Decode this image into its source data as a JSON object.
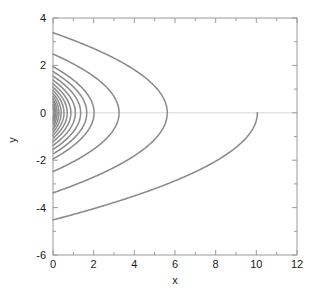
{
  "figure": {
    "background_color": "#ffffff",
    "plot_box": {
      "left": 53,
      "top": 18,
      "right": 297,
      "bottom": 255,
      "border_color": "#9a9a9a"
    }
  },
  "chart_data": {
    "type": "line",
    "title": "",
    "subtitle": "",
    "xlabel": "x",
    "ylabel": "y",
    "xlim": [
      0,
      12
    ],
    "ylim": [
      -6,
      4
    ],
    "xticks": [
      0,
      2,
      4,
      6,
      8,
      10,
      12
    ],
    "xtick_labels": [
      "0",
      "2",
      "4",
      "6",
      "8",
      "10",
      "12"
    ],
    "yticks": [
      -6,
      -4,
      -2,
      0,
      2,
      4
    ],
    "ytick_labels": [
      "-6",
      "-4",
      "-2",
      "0",
      "2",
      "4"
    ],
    "xminor_ticks": [
      1,
      3,
      5,
      7,
      9,
      11
    ],
    "yminor_ticks": [
      -5,
      -3,
      -1,
      1,
      3
    ],
    "grid": false,
    "legend": null,
    "annotations": [],
    "series_color": "#808080",
    "series_linewidth": 1.6,
    "zero_line_color": "#d8d8d8",
    "series": [
      {
        "name": "orbit-01",
        "y_at_x0": 0.22,
        "vertex_x": 0.035,
        "half": "full"
      },
      {
        "name": "orbit-02",
        "y_at_x0": 0.34,
        "vertex_x": 0.075,
        "half": "full"
      },
      {
        "name": "orbit-03",
        "y_at_x0": 0.46,
        "vertex_x": 0.13,
        "half": "full"
      },
      {
        "name": "orbit-04",
        "y_at_x0": 0.58,
        "vertex_x": 0.2,
        "half": "full"
      },
      {
        "name": "orbit-05",
        "y_at_x0": 0.7,
        "vertex_x": 0.29,
        "half": "full"
      },
      {
        "name": "orbit-06",
        "y_at_x0": 0.82,
        "vertex_x": 0.4,
        "half": "full"
      },
      {
        "name": "orbit-07",
        "y_at_x0": 0.95,
        "vertex_x": 0.54,
        "half": "full"
      },
      {
        "name": "orbit-08",
        "y_at_x0": 1.08,
        "vertex_x": 0.7,
        "half": "full"
      },
      {
        "name": "orbit-09",
        "y_at_x0": 1.22,
        "vertex_x": 0.88,
        "half": "full"
      },
      {
        "name": "orbit-10",
        "y_at_x0": 1.38,
        "vertex_x": 1.1,
        "half": "full"
      },
      {
        "name": "orbit-11",
        "y_at_x0": 1.55,
        "vertex_x": 1.36,
        "half": "full"
      },
      {
        "name": "orbit-12",
        "y_at_x0": 1.74,
        "vertex_x": 1.66,
        "half": "full"
      },
      {
        "name": "orbit-13",
        "y_at_x0": 1.95,
        "vertex_x": 2.02,
        "half": "full"
      },
      {
        "name": "orbit-14",
        "y_at_x0": 2.48,
        "vertex_x": 3.25,
        "half": "full"
      },
      {
        "name": "orbit-15",
        "y_at_x0": 3.38,
        "vertex_x": 5.62,
        "half": "full"
      },
      {
        "name": "orbit-16",
        "y_at_x0": -4.52,
        "vertex_x": 10.05,
        "half": "lower"
      }
    ]
  }
}
